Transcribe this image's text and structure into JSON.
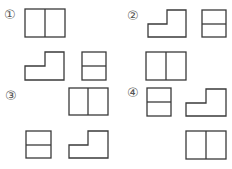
{
  "options": [
    {
      "label": "①",
      "views": [
        "split-rect-vertical",
        "l-shape",
        "split-rect-horizontal"
      ]
    },
    {
      "label": "②",
      "views": [
        "l-shape",
        "split-rect-horizontal",
        "split-rect-vertical"
      ]
    },
    {
      "label": "③",
      "views": [
        "split-rect-vertical",
        "split-rect-horizontal",
        "l-shape"
      ]
    },
    {
      "label": "④",
      "views": [
        "split-rect-horizontal",
        "l-shape",
        "split-rect-vertical"
      ]
    }
  ],
  "colors": {
    "stroke": "#3a3a3a",
    "label": "#555555",
    "background": "#ffffff"
  }
}
